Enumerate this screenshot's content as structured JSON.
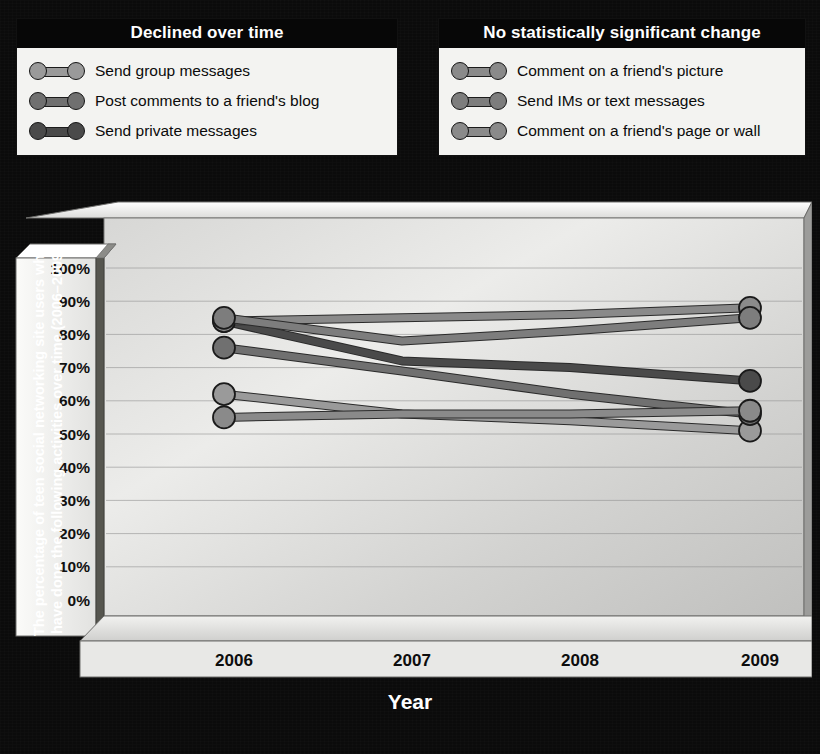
{
  "legends": [
    {
      "id": "declined",
      "title": "Declined over time",
      "items": [
        {
          "label": "Send group messages",
          "color": "#9a9a9a"
        },
        {
          "label": "Post comments to a friend's blog",
          "color": "#707070"
        },
        {
          "label": "Send private messages",
          "color": "#4a4a4a"
        }
      ]
    },
    {
      "id": "nochange",
      "title": "No statistically significant change",
      "items": [
        {
          "label": "Comment on a friend's picture",
          "color": "#8a8a8a"
        },
        {
          "label": "Send IMs or text messages",
          "color": "#7d7d7d"
        },
        {
          "label": "Comment on a friend's page or wall",
          "color": "#8a8a8a"
        }
      ]
    }
  ],
  "chart_data": {
    "type": "line",
    "title": "",
    "xlabel": "Year",
    "ylabel": "The percentage of teen social networking site users who have done the following activities over time (2006–2009)",
    "categories": [
      "2006",
      "2007",
      "2008",
      "2009"
    ],
    "x": [
      2006,
      2007,
      2008,
      2009
    ],
    "ylim": [
      0,
      100
    ],
    "ytick_labels": [
      "0%",
      "10%",
      "20%",
      "30%",
      "40%",
      "50%",
      "60%",
      "70%",
      "80%",
      "90%",
      "100%"
    ],
    "ytick_values": [
      0,
      10,
      20,
      30,
      40,
      50,
      60,
      70,
      80,
      90,
      100
    ],
    "grid": true,
    "legend_position": "top",
    "series": [
      {
        "name": "Send group messages",
        "group": "declined",
        "color": "#9a9a9a",
        "values": [
          62,
          56,
          54,
          51
        ]
      },
      {
        "name": "Post comments to a friend's blog",
        "group": "declined",
        "color": "#707070",
        "values": [
          76,
          69,
          62,
          56
        ]
      },
      {
        "name": "Send private messages",
        "group": "declined",
        "color": "#4a4a4a",
        "values": [
          84,
          72,
          70,
          66
        ]
      },
      {
        "name": "Comment on a friend's picture",
        "group": "nochange",
        "color": "#8a8a8a",
        "values": [
          84,
          85,
          86,
          88
        ]
      },
      {
        "name": "Send IMs or text messages",
        "group": "nochange",
        "color": "#7d7d7d",
        "values": [
          85,
          78,
          81,
          85
        ]
      },
      {
        "name": "Comment on a friend's page or wall",
        "group": "nochange",
        "color": "#8a8a8a",
        "values": [
          55,
          56,
          56,
          57
        ]
      }
    ]
  },
  "colors": {
    "page_background": "#0b0b0b",
    "legend_background": "#f3f3f1",
    "legend_title_background": "#070707",
    "plot_light": "#e9e9e7",
    "plot_dark": "#b8b8b6",
    "gridline": "#8f8f8f",
    "axis_wall": "#5a5a5a"
  }
}
